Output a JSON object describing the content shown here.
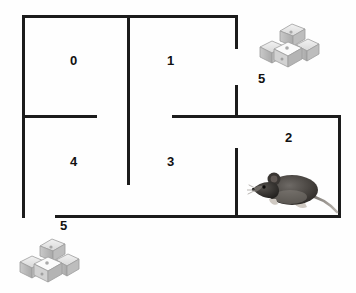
{
  "diagram": {
    "background_color": "#fefefe",
    "wall_color": "#1c1c1c",
    "label_color": "#111111"
  },
  "rooms": [
    {
      "id": "0",
      "label": "0",
      "x": 70,
      "y": 54
    },
    {
      "id": "1",
      "label": "1",
      "x": 167,
      "y": 54
    },
    {
      "id": "2",
      "label": "2",
      "x": 285,
      "y": 131
    },
    {
      "id": "3",
      "label": "3",
      "x": 167,
      "y": 155
    },
    {
      "id": "4",
      "label": "4",
      "x": 70,
      "y": 155
    }
  ],
  "goals": [
    {
      "id": "goal-top-right",
      "label": "5",
      "label_x": 258,
      "label_y": 72,
      "cheese_x": 258,
      "cheese_y": 21
    },
    {
      "id": "goal-bottom-left",
      "label": "5",
      "label_x": 60,
      "label_y": 219,
      "cheese_x": 18,
      "cheese_y": 236
    }
  ],
  "agent": {
    "id": "mouse",
    "name": "mouse",
    "room": "2",
    "x": 247,
    "y": 163,
    "facing": "left"
  },
  "walls": [
    {
      "name": "outer-top-wall",
      "orientation": "h",
      "x": 22,
      "y": 15,
      "length": 216
    },
    {
      "name": "outer-left-wall",
      "orientation": "v",
      "x": 22,
      "y": 15,
      "length": 203
    },
    {
      "name": "outer-bottom-wall",
      "orientation": "h",
      "x": 55,
      "y": 215,
      "length": 286
    },
    {
      "name": "outer-right-wall",
      "orientation": "v",
      "x": 338,
      "y": 115,
      "length": 103
    },
    {
      "name": "center-vertical-wall",
      "orientation": "v",
      "x": 127,
      "y": 15,
      "length": 170
    },
    {
      "name": "room0-room4-divider",
      "orientation": "h",
      "x": 22,
      "y": 115,
      "length": 75
    },
    {
      "name": "room2-top-wall",
      "orientation": "h",
      "x": 172,
      "y": 115,
      "length": 169
    },
    {
      "name": "goal5-upper-wall",
      "orientation": "v",
      "x": 235,
      "y": 15,
      "length": 34
    },
    {
      "name": "goal5-lower-wall",
      "orientation": "v",
      "x": 235,
      "y": 85,
      "length": 33
    },
    {
      "name": "room2-room3-divider",
      "orientation": "v",
      "x": 235,
      "y": 148,
      "length": 70
    }
  ]
}
